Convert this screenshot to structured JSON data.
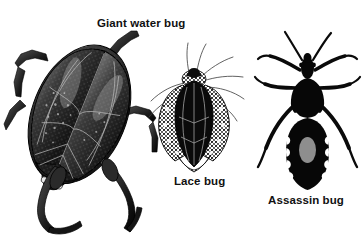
{
  "plate": {
    "background_color": "#ffffff",
    "ink_color": "#111111",
    "width": 363,
    "height": 237,
    "style": "black-and-white halftone engraving"
  },
  "figures": [
    {
      "id": "giant-water-bug",
      "label": "Giant water bug",
      "common_name": "Giant water bug",
      "view": "dorsal",
      "orientation": "tilted diagonally, head toward lower right",
      "tone": "dark gray halftone with fine wing venation",
      "features": [
        "broad oval body",
        "overlapping hemelytra with visible veins",
        "raptorial front legs",
        "long flattened swimming legs"
      ]
    },
    {
      "id": "lace-bug",
      "label": "Lace bug",
      "common_name": "Lace bug",
      "view": "dorsal",
      "orientation": "upright, head at top",
      "tone": "black body with lacy white wing margins",
      "features": [
        "dark central body",
        "expanded lacy reticulate paranota",
        "fine hairline antennae",
        "slender legs"
      ]
    },
    {
      "id": "assassin-bug",
      "label": "Assassin bug",
      "common_name": "Assassin bug",
      "view": "dorsal",
      "orientation": "upright, head at top",
      "tone": "solid black silhouette",
      "features": [
        "narrow head with long antennae",
        "pale gray oval spot on abdomen",
        "white scalloped abdominal margins",
        "white chevron mark behind pronotum",
        "six splayed legs"
      ]
    }
  ]
}
